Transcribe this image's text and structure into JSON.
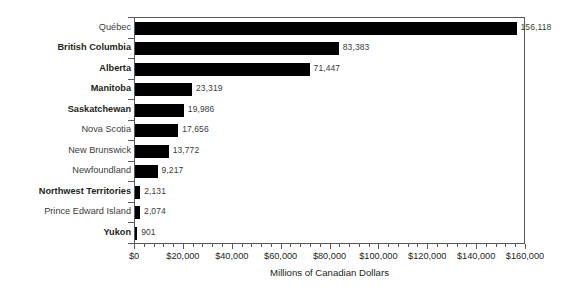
{
  "chart_data": {
    "type": "bar",
    "orientation": "horizontal",
    "title": "",
    "subtitle": "",
    "xlabel": "Millions of Canadian Dollars",
    "ylabel": "",
    "xlim": [
      0,
      160000
    ],
    "grid": false,
    "legend": null,
    "categories": [
      "Québec",
      "British Columbia",
      "Alberta",
      "Manitoba",
      "Saskatchewan",
      "Nova Scotia",
      "New Brunswick",
      "Newfoundland",
      "Northwest Territories",
      "Prince Edward Island",
      "Yukon"
    ],
    "values": [
      156118,
      83383,
      71447,
      23319,
      19986,
      17656,
      13772,
      9217,
      2131,
      2074,
      901
    ],
    "value_labels": [
      "156,118",
      "83,383",
      "71,447",
      "23,319",
      "19,986",
      "17,656",
      "13,772",
      "9,217",
      "2,131",
      "2,074",
      "901"
    ],
    "category_styles": [
      "regular",
      "bold",
      "bold",
      "bold",
      "bold",
      "regular",
      "regular",
      "regular",
      "bold",
      "regular",
      "bold"
    ],
    "xticks": [
      0,
      20000,
      40000,
      60000,
      80000,
      100000,
      120000,
      140000,
      160000
    ],
    "xticklabels": [
      "$0",
      "$20,000",
      "$40,000",
      "$60,000",
      "$80,000",
      "$100,000",
      "$120,000",
      "$140,000",
      "$160,000"
    ],
    "minor_ticks_between_majors": 4,
    "bar_color": "#000000",
    "axis_color": "#58595b",
    "label_color": "#231f20",
    "value_label_color": "#3b3b3b",
    "background_color": "#ffffff"
  }
}
